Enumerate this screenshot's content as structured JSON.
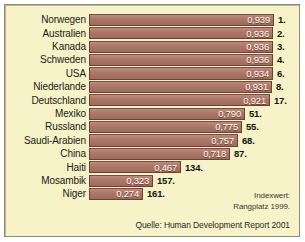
{
  "chart_data": {
    "type": "bar",
    "orientation": "horizontal",
    "title": "",
    "xlabel": "",
    "ylabel": "",
    "xlim": [
      0,
      1
    ],
    "grid": false,
    "legend_position": "bottom-right",
    "categories": [
      "Norwegen",
      "Australien",
      "Kanada",
      "Schweden",
      "USA",
      "Niederlande",
      "Deutschland",
      "Mexiko",
      "Russland",
      "Saudi-Arabien",
      "China",
      "Haiti",
      "Mosambik",
      "Niger"
    ],
    "values": [
      0.939,
      0.936,
      0.936,
      0.936,
      0.934,
      0.931,
      0.921,
      0.79,
      0.775,
      0.757,
      0.718,
      0.467,
      0.323,
      0.274
    ],
    "value_labels": [
      "0,939",
      "0,936",
      "0,936",
      "0,936",
      "0,934",
      "0,931",
      "0,921",
      "0,790",
      "0,775",
      "0,757",
      "0,718",
      "0,467",
      "0,323",
      "0,274"
    ],
    "rank_labels": [
      "1.",
      "2.",
      "3.",
      "4.",
      "6.",
      "8.",
      "17.",
      "51.",
      "55.",
      "68.",
      "87.",
      "134.",
      "157.",
      "161."
    ],
    "ranks": [
      1,
      2,
      3,
      4,
      6,
      8,
      17,
      51,
      55,
      68,
      87,
      134,
      157,
      161
    ],
    "series": [
      {
        "name": "Indexwert",
        "values": [
          0.939,
          0.936,
          0.936,
          0.936,
          0.934,
          0.931,
          0.921,
          0.79,
          0.775,
          0.757,
          0.718,
          0.467,
          0.323,
          0.274
        ]
      }
    ],
    "annotations": {
      "legend_line_1": "Indexwert:",
      "legend_line_2": "Rangplatz 1999.",
      "source": "Quelle: Human Development Report 2001"
    },
    "colors": {
      "background": "#f7f3c8",
      "bar_fill": "#ab7668",
      "bar_border": "#6d3f35",
      "value_text": "#fffdf4",
      "rank_text": "#14130f",
      "frame_border": "#8e8a72"
    }
  }
}
